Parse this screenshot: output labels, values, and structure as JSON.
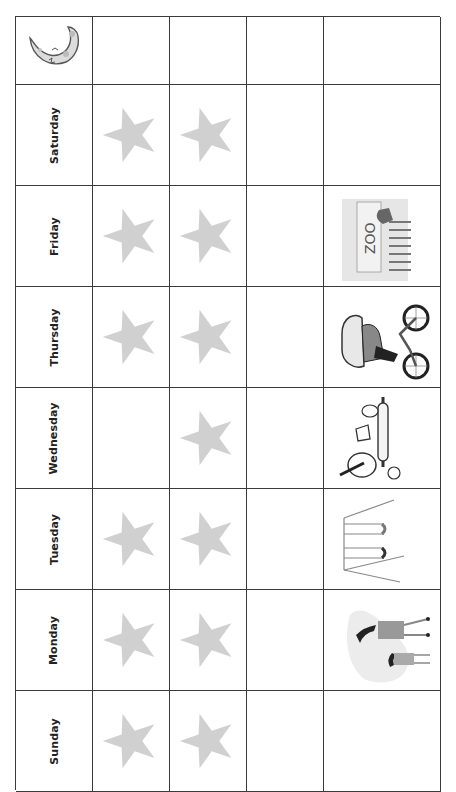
{
  "chart": {
    "header_icon": "moon-icon",
    "rows": [
      {
        "day": "Saturday",
        "col1": "star",
        "col2": "star",
        "col3": "",
        "activity_icon": ""
      },
      {
        "day": "Friday",
        "col1": "star",
        "col2": "star",
        "col3": "",
        "activity_icon": "zoo-icon"
      },
      {
        "day": "Thursday",
        "col1": "star",
        "col2": "star",
        "col3": "",
        "activity_icon": "bicycle-rider-icon"
      },
      {
        "day": "Wednesday",
        "col1": "",
        "col2": "star",
        "col3": "",
        "activity_icon": "baking-icon"
      },
      {
        "day": "Tuesday",
        "col1": "star",
        "col2": "star",
        "col3": "",
        "activity_icon": "swing-set-icon"
      },
      {
        "day": "Monday",
        "col1": "star",
        "col2": "star",
        "col3": "",
        "activity_icon": "parent-child-walk-icon"
      },
      {
        "day": "Sunday",
        "col1": "star",
        "col2": "star",
        "col3": "",
        "activity_icon": ""
      }
    ]
  },
  "colors": {
    "grid_line": "#3a3a3a",
    "star_fill": "#d0d0d0",
    "moon_fill": "#dcdcdc",
    "label_text": "#222222"
  }
}
